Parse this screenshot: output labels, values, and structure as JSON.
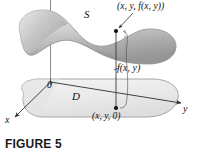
{
  "figure": {
    "caption": "FIGURE 5",
    "labels": {
      "surface": "S",
      "domain": "D",
      "origin": "0",
      "axis_x": "x",
      "axis_y": "y",
      "point_top": "(x, y, f(x, y))",
      "height_value": "f(x, y)",
      "point_base": "(x, y, 0)"
    },
    "colors": {
      "surface_light": "#e3e3e3",
      "surface_mid": "#bdbdbd",
      "surface_dark": "#9a9a9a",
      "domain_fill": "#ededed",
      "outline": "#6e6e6e",
      "line": "#3a3a3a",
      "text": "#111111"
    }
  }
}
